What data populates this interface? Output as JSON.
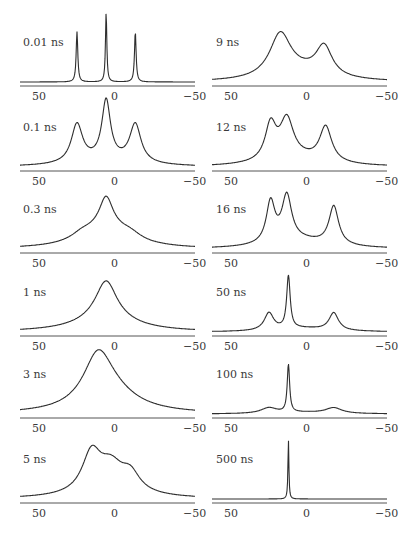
{
  "figure": {
    "x_axis": {
      "min": 50,
      "max": -50,
      "tick_labels": [
        "50",
        "0",
        "−50"
      ],
      "tick_values": [
        50,
        0,
        -50
      ]
    }
  },
  "chart_data": {
    "type": "line",
    "title": "",
    "xlabel": "",
    "ylabel": "",
    "xlim": [
      50,
      -50
    ],
    "grid": false,
    "legend": "none",
    "layout": "2 columns x 6 rows of stacked spectra, each with x-axis ticks 50, 0, -50",
    "panels": [
      {
        "label": "0.01 ns",
        "column": 0,
        "row": 0,
        "peaks": [
          {
            "x": 21,
            "h": 0.72,
            "w": 0.6
          },
          {
            "x": 3,
            "h": 1.0,
            "w": 0.5
          },
          {
            "x": -15,
            "h": 0.72,
            "w": 0.6
          }
        ]
      },
      {
        "label": "0.1 ns",
        "column": 0,
        "row": 1,
        "peaks": [
          {
            "x": 21,
            "h": 0.55,
            "w": 4.2
          },
          {
            "x": 3,
            "h": 0.85,
            "w": 3.2
          },
          {
            "x": -15,
            "h": 0.55,
            "w": 4.2
          },
          {
            "x": 3,
            "h": 0.08,
            "w": 25
          }
        ]
      },
      {
        "label": "0.3 ns",
        "column": 0,
        "row": 2,
        "peaks": [
          {
            "x": 3,
            "h": 0.42,
            "w": 5
          },
          {
            "x": 3,
            "h": 0.3,
            "w": 18
          },
          {
            "x": 18,
            "h": 0.08,
            "w": 8
          },
          {
            "x": -12,
            "h": 0.08,
            "w": 8
          }
        ]
      },
      {
        "label": "1 ns",
        "column": 0,
        "row": 3,
        "peaks": [
          {
            "x": 3,
            "h": 0.55,
            "w": 8
          },
          {
            "x": 3,
            "h": 0.18,
            "w": 22
          }
        ]
      },
      {
        "label": "3 ns",
        "column": 0,
        "row": 4,
        "peaks": [
          {
            "x": 8,
            "h": 0.7,
            "w": 11
          },
          {
            "x": 0,
            "h": 0.25,
            "w": 20
          }
        ]
      },
      {
        "label": "5 ns",
        "column": 0,
        "row": 5,
        "peaks": [
          {
            "x": 12,
            "h": 0.55,
            "w": 7
          },
          {
            "x": 0,
            "h": 0.35,
            "w": 9
          },
          {
            "x": -12,
            "h": 0.25,
            "w": 7
          },
          {
            "x": 0,
            "h": 0.08,
            "w": 25
          }
        ]
      },
      {
        "label": "9 ns",
        "column": 1,
        "row": 0,
        "peaks": [
          {
            "x": 14,
            "h": 0.62,
            "w": 8
          },
          {
            "x": -13,
            "h": 0.42,
            "w": 6
          },
          {
            "x": 0,
            "h": 0.12,
            "w": 20
          }
        ]
      },
      {
        "label": "12 ns",
        "column": 1,
        "row": 1,
        "peaks": [
          {
            "x": 20,
            "h": 0.5,
            "w": 4
          },
          {
            "x": 10,
            "h": 0.55,
            "w": 5
          },
          {
            "x": -14,
            "h": 0.5,
            "w": 4.5
          },
          {
            "x": 5,
            "h": 0.12,
            "w": 22
          }
        ]
      },
      {
        "label": "16 ns",
        "column": 1,
        "row": 2,
        "peaks": [
          {
            "x": 20,
            "h": 0.58,
            "w": 3.2
          },
          {
            "x": 10,
            "h": 0.64,
            "w": 3.6
          },
          {
            "x": -19,
            "h": 0.55,
            "w": 3.6
          },
          {
            "x": 3,
            "h": 0.12,
            "w": 22
          }
        ]
      },
      {
        "label": "50 ns",
        "column": 1,
        "row": 3,
        "peaks": [
          {
            "x": 21,
            "h": 0.25,
            "w": 3.5
          },
          {
            "x": 9,
            "h": 0.75,
            "w": 1.3
          },
          {
            "x": -19,
            "h": 0.25,
            "w": 3.5
          },
          {
            "x": 0,
            "h": 0.05,
            "w": 20
          }
        ]
      },
      {
        "label": "100 ns",
        "column": 1,
        "row": 4,
        "peaks": [
          {
            "x": 21,
            "h": 0.08,
            "w": 6
          },
          {
            "x": 9,
            "h": 0.68,
            "w": 0.9
          },
          {
            "x": -19,
            "h": 0.08,
            "w": 6
          },
          {
            "x": 0,
            "h": 0.02,
            "w": 20
          }
        ]
      },
      {
        "label": "500 ns",
        "column": 1,
        "row": 5,
        "peaks": [
          {
            "x": 9,
            "h": 0.85,
            "w": 0.35
          }
        ]
      }
    ]
  }
}
